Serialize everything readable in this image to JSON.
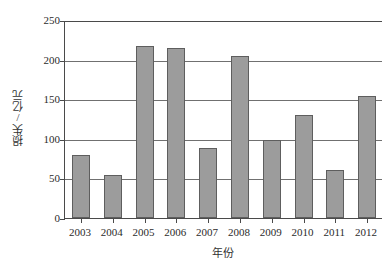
{
  "chart_data": {
    "type": "bar",
    "title": "",
    "subtitle": "",
    "xlabel": "年份",
    "ylabel": "损失/亿元",
    "categories": [
      "2003",
      "2004",
      "2005",
      "2006",
      "2007",
      "2008",
      "2009",
      "2010",
      "2011",
      "2012"
    ],
    "values": [
      80,
      54,
      217,
      215,
      88,
      204,
      99,
      130,
      60,
      154
    ],
    "series": [
      {
        "name": "损失",
        "values": [
          80,
          54,
          217,
          215,
          88,
          204,
          99,
          130,
          60,
          154
        ]
      }
    ],
    "ylim": [
      0,
      250
    ],
    "ytick_labels": [
      "0",
      "50",
      "100",
      "150",
      "200",
      "250"
    ],
    "ytick_values": [
      0,
      50,
      100,
      150,
      200,
      250
    ],
    "grid": true,
    "grid_axis": "y",
    "legend": false,
    "legend_position": "none",
    "bar_color": "#9c9c9c",
    "bar_edge_color": "#5e5e5e",
    "axis_color": "#4a4a4a",
    "gridline_color": "#707070",
    "background_color": "#ffffff"
  }
}
